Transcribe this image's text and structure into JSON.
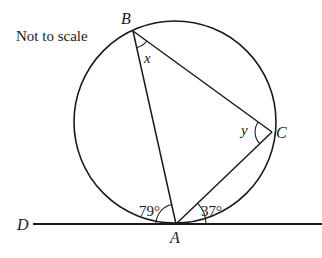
{
  "diagram": {
    "note": "Not to scale",
    "type": "circle-theorem",
    "points": {
      "A": {
        "label": "A",
        "x": 176,
        "y": 224
      },
      "B": {
        "label": "B",
        "x": 133,
        "y": 31
      },
      "C": {
        "label": "C",
        "x": 272,
        "y": 132
      },
      "D": {
        "label": "D"
      }
    },
    "circle": {
      "cx": 175,
      "cy": 122,
      "r": 101
    },
    "tangent_line": {
      "x1": 33,
      "x2": 322,
      "y": 224
    },
    "angles": {
      "x": {
        "label": "x",
        "at": "B"
      },
      "y": {
        "label": "y",
        "at": "C"
      },
      "DAB": {
        "label": "79°",
        "at": "A"
      },
      "CA_tangent": {
        "label": "37°",
        "at": "A"
      }
    },
    "colors": {
      "stroke": "#1a1a1a",
      "background": "#ffffff"
    }
  }
}
